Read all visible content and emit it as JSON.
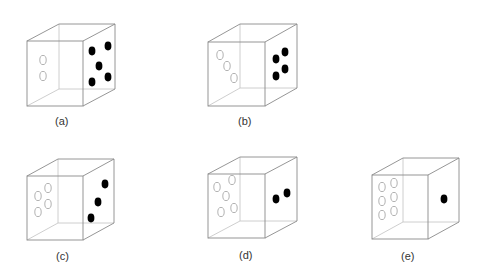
{
  "figure": {
    "dice": [
      {
        "label": "(a)",
        "front_face_dots": 2,
        "right_face_dots": 5
      },
      {
        "label": "(b)",
        "front_face_dots": 3,
        "right_face_dots": 4
      },
      {
        "label": "(c)",
        "front_face_dots": 4,
        "right_face_dots": 3
      },
      {
        "label": "(d)",
        "front_face_dots": 5,
        "right_face_dots": 2
      },
      {
        "label": "(e)",
        "front_face_dots": 6,
        "right_face_dots": 1
      }
    ]
  },
  "colors": {
    "edge": "#8a8a8a",
    "hollow_dot": "#a9a9a9",
    "solid_dot": "#000000"
  }
}
